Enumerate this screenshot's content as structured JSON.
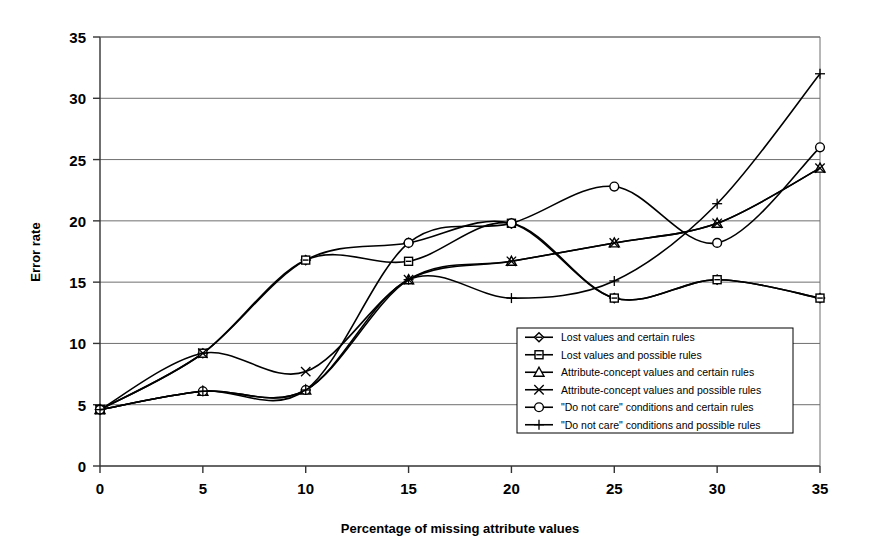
{
  "chart_data": {
    "type": "line",
    "title": "",
    "xlabel": "Percentage of missing attribute values",
    "ylabel": "Error rate",
    "x": [
      0,
      5,
      10,
      15,
      20,
      25,
      30,
      35
    ],
    "xlim": [
      0,
      35
    ],
    "ylim": [
      0,
      35
    ],
    "xticks": [
      "0",
      "5",
      "10",
      "15",
      "20",
      "25",
      "30",
      "35"
    ],
    "yticks": [
      "0",
      "5",
      "10",
      "15",
      "20",
      "25",
      "30",
      "35"
    ],
    "grid": "horizontal",
    "legend_position": "inside-lower-right",
    "series": [
      {
        "name": "Lost values and certain rules",
        "marker": "diamond",
        "values": [
          4.6,
          9.2,
          16.8,
          18.2,
          19.8,
          13.7,
          15.2,
          13.7
        ]
      },
      {
        "name": "Lost values and possible rules",
        "marker": "square",
        "values": [
          4.6,
          9.2,
          16.8,
          16.7,
          19.8,
          13.7,
          15.2,
          13.7
        ]
      },
      {
        "name": "Attribute-concept values and certain rules",
        "marker": "triangle",
        "values": [
          4.6,
          6.1,
          6.2,
          15.2,
          16.7,
          18.2,
          19.8,
          24.3
        ]
      },
      {
        "name": "Attribute-concept values and possible rules",
        "marker": "x",
        "values": [
          4.6,
          9.2,
          7.7,
          15.2,
          16.7,
          18.2,
          19.8,
          24.3
        ]
      },
      {
        "name": "\"Do not care\" conditions and certain rules",
        "marker": "circle",
        "values": [
          4.6,
          6.1,
          6.2,
          18.2,
          19.8,
          22.8,
          18.2,
          26.0
        ]
      },
      {
        "name": "\"Do not care\" conditions and possible rules",
        "marker": "plus",
        "values": [
          4.6,
          6.1,
          6.2,
          15.2,
          13.7,
          15.1,
          21.4,
          32.0
        ]
      }
    ]
  },
  "axes": {
    "y_title": "Error rate",
    "x_title": "Percentage of missing attribute values"
  },
  "colors": {
    "ink": "#000000",
    "grid": "#6f6f6f",
    "background": "#ffffff"
  }
}
